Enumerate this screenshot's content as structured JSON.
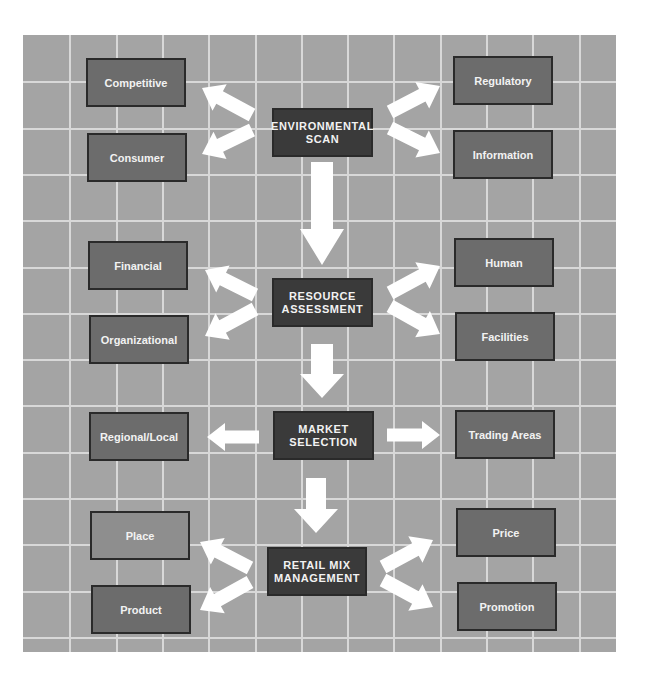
{
  "diagram": {
    "type": "retail-strategy-flowchart",
    "colors": {
      "background": "#ffffff",
      "grid_fill": "#a4a4a4",
      "grid_lines": "#d8d8d8",
      "center_box": "#3a3a3a",
      "outer_box": "#6c6c6c",
      "outer_box_light": "#8e8e8e",
      "arrow": "#ffffff",
      "text": "#f2f2f2"
    },
    "stages": [
      {
        "id": "environmental-scan",
        "label_line1": "ENVIRONMENTAL",
        "label_line2": "SCAN",
        "left": [
          "Competitive",
          "Consumer"
        ],
        "right": [
          "Regulatory",
          "Information"
        ]
      },
      {
        "id": "resource-assessment",
        "label_line1": "RESOURCE",
        "label_line2": "ASSESSMENT",
        "left": [
          "Financial",
          "Organizational"
        ],
        "right": [
          "Human",
          "Facilities"
        ]
      },
      {
        "id": "market-selection",
        "label_line1": "MARKET",
        "label_line2": "SELECTION",
        "left": [
          "Regional/Local"
        ],
        "right": [
          "Trading Areas"
        ]
      },
      {
        "id": "retail-mix-management",
        "label_line1": "RETAIL MIX",
        "label_line2": "MANAGEMENT",
        "left": [
          "Place",
          "Product"
        ],
        "right": [
          "Price",
          "Promotion"
        ]
      }
    ],
    "flow": [
      "environmental-scan",
      "resource-assessment",
      "market-selection",
      "retail-mix-management"
    ]
  }
}
